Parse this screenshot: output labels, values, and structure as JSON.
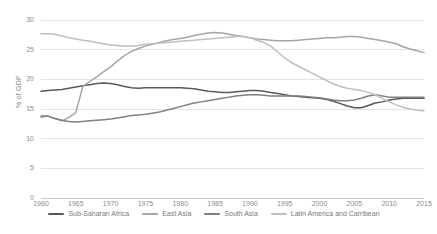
{
  "chart_data": {
    "type": "line",
    "title": "",
    "xlabel": "",
    "ylabel": "% of GDP",
    "xlim": [
      1960,
      2015
    ],
    "ylim": [
      0,
      30
    ],
    "yticks": [
      "0",
      "5",
      "10",
      "15",
      "20",
      "25",
      "30"
    ],
    "xticks": [
      "1960",
      "1965",
      "1970",
      "1975",
      "1980",
      "1985",
      "1990",
      "1995",
      "2000",
      "2005",
      "2010",
      "2015"
    ],
    "grid": "horizontal",
    "legend_position": "bottom",
    "x": [
      1960,
      1961,
      1962,
      1963,
      1964,
      1965,
      1966,
      1967,
      1968,
      1969,
      1970,
      1971,
      1972,
      1973,
      1974,
      1975,
      1976,
      1977,
      1978,
      1979,
      1980,
      1981,
      1982,
      1983,
      1984,
      1985,
      1986,
      1987,
      1988,
      1989,
      1990,
      1991,
      1992,
      1993,
      1994,
      1995,
      1996,
      1997,
      1998,
      1999,
      2000,
      2001,
      2002,
      2003,
      2004,
      2005,
      2006,
      2007,
      2008,
      2009,
      2010,
      2011,
      2012,
      2013,
      2014,
      2015
    ],
    "series": [
      {
        "name": "Sub-Saharan Africa",
        "color": "#595959",
        "values": [
          18.0,
          18.1,
          18.2,
          18.3,
          18.5,
          18.7,
          18.9,
          19.1,
          19.3,
          19.4,
          19.3,
          19.1,
          18.8,
          18.6,
          18.5,
          18.6,
          18.6,
          18.6,
          18.6,
          18.6,
          18.6,
          18.5,
          18.4,
          18.2,
          18.0,
          17.9,
          17.8,
          17.8,
          17.9,
          18.0,
          18.1,
          18.1,
          18.0,
          17.8,
          17.6,
          17.4,
          17.2,
          17.1,
          17.0,
          16.9,
          16.8,
          16.6,
          16.3,
          15.9,
          15.5,
          15.2,
          15.2,
          15.6,
          16.0,
          16.2,
          16.5,
          16.7,
          16.8,
          16.8,
          16.8,
          16.8
        ]
      },
      {
        "name": "East Asia",
        "color": "#a6a6a6",
        "values": [
          13.6,
          13.8,
          13.4,
          13.0,
          13.6,
          14.4,
          18.8,
          19.6,
          20.4,
          21.3,
          22.1,
          23.1,
          24.0,
          24.7,
          25.2,
          25.6,
          25.9,
          26.2,
          26.5,
          26.7,
          26.9,
          27.1,
          27.4,
          27.6,
          27.8,
          27.9,
          27.8,
          27.6,
          27.4,
          27.2,
          27.0,
          26.8,
          26.7,
          26.6,
          26.5,
          26.5,
          26.5,
          26.6,
          26.7,
          26.8,
          26.9,
          27.0,
          27.0,
          27.1,
          27.2,
          27.2,
          27.1,
          26.9,
          26.7,
          26.5,
          26.3,
          26.0,
          25.5,
          25.1,
          24.8,
          24.5
        ]
      },
      {
        "name": "South Asia",
        "color": "#808080",
        "values": [
          13.8,
          13.8,
          13.4,
          13.1,
          12.9,
          12.8,
          12.9,
          13.0,
          13.1,
          13.2,
          13.3,
          13.5,
          13.7,
          13.9,
          14.0,
          14.1,
          14.3,
          14.5,
          14.8,
          15.1,
          15.4,
          15.7,
          16.0,
          16.2,
          16.4,
          16.6,
          16.8,
          17.0,
          17.2,
          17.3,
          17.4,
          17.4,
          17.3,
          17.2,
          17.2,
          17.2,
          17.2,
          17.2,
          17.1,
          17.0,
          16.9,
          16.7,
          16.5,
          16.4,
          16.4,
          16.5,
          16.8,
          17.2,
          17.4,
          17.2,
          17.0,
          17.0,
          17.0,
          17.0,
          17.0,
          17.0
        ]
      },
      {
        "name": "Latin America and Carribean",
        "color": "#bfbfbf",
        "values": [
          27.7,
          27.7,
          27.6,
          27.3,
          27.0,
          26.8,
          26.6,
          26.4,
          26.2,
          26.0,
          25.8,
          25.7,
          25.6,
          25.6,
          25.7,
          25.9,
          26.0,
          26.1,
          26.2,
          26.3,
          26.4,
          26.5,
          26.6,
          26.7,
          26.8,
          26.9,
          27.0,
          27.1,
          27.2,
          27.2,
          27.0,
          26.6,
          26.2,
          25.6,
          24.6,
          23.6,
          22.8,
          22.2,
          21.6,
          21.0,
          20.4,
          19.8,
          19.2,
          18.8,
          18.5,
          18.3,
          18.1,
          17.8,
          17.4,
          16.8,
          16.2,
          15.7,
          15.3,
          15.0,
          14.8,
          14.7
        ]
      }
    ]
  }
}
